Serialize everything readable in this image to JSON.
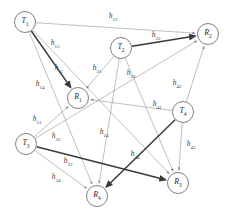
{
  "diagram": {
    "background_color": "#ffffff",
    "node_stroke_color": "#4a4a4a",
    "edge_thin_color": "#8a8a8a",
    "edge_thick_color": "#3a3a3a",
    "nodes": [
      {
        "id": "T1",
        "base": "T",
        "sub": "1",
        "cx": 25,
        "cy": 22,
        "r": 10.5
      },
      {
        "id": "T2",
        "base": "T",
        "sub": "2",
        "cx": 121,
        "cy": 48,
        "r": 10.5
      },
      {
        "id": "T3",
        "base": "T",
        "sub": "3",
        "cx": 26,
        "cy": 144,
        "r": 10.5
      },
      {
        "id": "T4",
        "base": "T",
        "sub": "4",
        "cx": 183,
        "cy": 112,
        "r": 10.5
      },
      {
        "id": "R1",
        "base": "R",
        "sub": "1",
        "cx": 78,
        "cy": 98,
        "r": 10.5
      },
      {
        "id": "R2",
        "base": "R",
        "sub": "2",
        "cx": 208,
        "cy": 34,
        "r": 10.5
      },
      {
        "id": "R3",
        "base": "R",
        "sub": "3",
        "cx": 178,
        "cy": 183,
        "r": 10.5
      },
      {
        "id": "R4",
        "base": "R",
        "sub": "4",
        "cx": 97,
        "cy": 196,
        "r": 10.5
      }
    ],
    "edges": [
      {
        "id": "e-h12",
        "from": "T1",
        "to": "R2",
        "weight": "thin",
        "label": "h",
        "sub": "12",
        "lx": 113,
        "ly": 17
      },
      {
        "id": "e-h13",
        "from": "T1",
        "to": "R3",
        "weight": "thin",
        "label": "h",
        "sub": "13",
        "lx": 55,
        "ly": 44
      },
      {
        "id": "e-h11",
        "from": "T1",
        "to": "R1",
        "weight": "thick",
        "label": "h",
        "sub": "11",
        "lx": 59,
        "ly": 69
      },
      {
        "id": "e-h14",
        "from": "T1",
        "to": "R4",
        "weight": "thin",
        "label": "h",
        "sub": "14",
        "lx": 40,
        "ly": 85
      },
      {
        "id": "e-h21",
        "from": "T2",
        "to": "R1",
        "weight": "thin",
        "label": "h",
        "sub": "21",
        "lx": 97,
        "ly": 69
      },
      {
        "id": "e-h22",
        "from": "T2",
        "to": "R2",
        "weight": "thick",
        "label": "h",
        "sub": "22",
        "lx": 156,
        "ly": 36
      },
      {
        "id": "e-h23",
        "from": "T2",
        "to": "R3",
        "weight": "thin",
        "label": "h",
        "sub": "23",
        "lx": 131,
        "ly": 74
      },
      {
        "id": "e-h24",
        "from": "T2",
        "to": "R4",
        "weight": "thin",
        "label": "h",
        "sub": "24",
        "lx": 104,
        "ly": 133
      },
      {
        "id": "e-h31",
        "from": "T3",
        "to": "R1",
        "weight": "thin",
        "label": "h",
        "sub": "31",
        "lx": 37,
        "ly": 120
      },
      {
        "id": "e-h32",
        "from": "T3",
        "to": "R2",
        "weight": "thin",
        "label": "h",
        "sub": "32",
        "lx": 56,
        "ly": 137
      },
      {
        "id": "e-h33",
        "from": "T3",
        "to": "R3",
        "weight": "thick",
        "label": "h",
        "sub": "33",
        "lx": 68,
        "ly": 162
      },
      {
        "id": "e-h34",
        "from": "T3",
        "to": "R4",
        "weight": "thin",
        "label": "h",
        "sub": "34",
        "lx": 56,
        "ly": 178
      },
      {
        "id": "e-h41",
        "from": "T4",
        "to": "R1",
        "weight": "thin",
        "label": "h",
        "sub": "41",
        "lx": 157,
        "ly": 105
      },
      {
        "id": "e-h42",
        "from": "T4",
        "to": "R2",
        "weight": "thin",
        "label": "h",
        "sub": "42",
        "lx": 177,
        "ly": 84
      },
      {
        "id": "e-h43",
        "from": "T4",
        "to": "R3",
        "weight": "thin",
        "label": "h",
        "sub": "43",
        "lx": 191,
        "ly": 145
      },
      {
        "id": "e-h44",
        "from": "T4",
        "to": "R4",
        "weight": "thick",
        "label": "h",
        "sub": "44",
        "lx": 135,
        "ly": 155
      }
    ]
  }
}
